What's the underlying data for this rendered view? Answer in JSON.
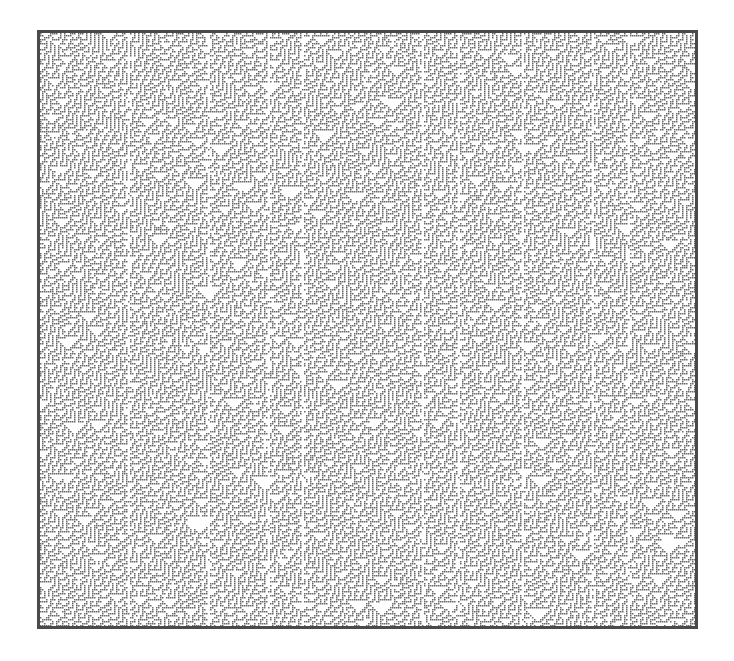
{
  "figure": {
    "type": "cellular-automaton-pattern",
    "frame": {
      "x": 37,
      "y": 30,
      "width": 661,
      "height": 599,
      "border_px": 3
    },
    "cell_px": 2,
    "colors": {
      "on": "#6a6a6a",
      "off": "#ffffff",
      "border": "#4a4a4a",
      "background": "#ffffff"
    },
    "rule": 110,
    "seed": 1337,
    "streak_columns_px": [
      88,
      168,
      228,
      262,
      383,
      418,
      483,
      553,
      588
    ]
  }
}
